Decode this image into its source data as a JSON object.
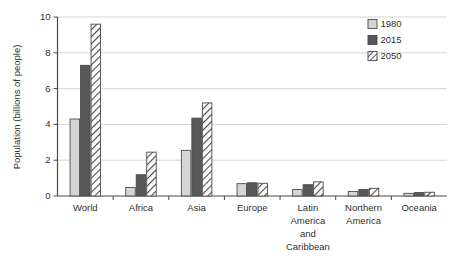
{
  "chart_data": {
    "type": "bar",
    "title": "",
    "xlabel": "",
    "ylabel": "Population (billions of people)",
    "ylim": [
      0,
      10
    ],
    "yticks": [
      0,
      2,
      4,
      6,
      8,
      10
    ],
    "ytick_labels": [
      "0",
      "2",
      "4",
      "6",
      "8",
      "10"
    ],
    "grid": true,
    "legend_position": "top-right",
    "categories": [
      "World",
      "Africa",
      "Asia",
      "Europe",
      "Latin America and Caribbean",
      "Northern America",
      "Oceania"
    ],
    "category_label_lines": [
      [
        "World"
      ],
      [
        "Africa"
      ],
      [
        "Asia"
      ],
      [
        "Europe"
      ],
      [
        "Latin",
        "America",
        "and",
        "Caribbean"
      ],
      [
        "Northern",
        "America"
      ],
      [
        "Oceania"
      ]
    ],
    "series": [
      {
        "name": "1980",
        "fill": "#d5d5d5",
        "pattern": "solid",
        "values": [
          4.3,
          0.48,
          2.55,
          0.69,
          0.36,
          0.25,
          0.15
        ]
      },
      {
        "name": "2015",
        "fill": "#585858",
        "pattern": "solid",
        "values": [
          7.3,
          1.19,
          4.35,
          0.74,
          0.63,
          0.36,
          0.19
        ]
      },
      {
        "name": "2050",
        "fill": "#ffffff",
        "pattern": "diagonal-hatch",
        "values": [
          9.6,
          2.45,
          5.2,
          0.71,
          0.79,
          0.43,
          0.21
        ]
      }
    ]
  },
  "legend": {
    "entries": [
      {
        "label": "1980",
        "swatch": "light-gray-swatch"
      },
      {
        "label": "2015",
        "swatch": "dark-gray-swatch"
      },
      {
        "label": "2050",
        "swatch": "hatched-swatch"
      }
    ]
  },
  "colors": {
    "series_1980": "#d5d5d5",
    "series_2015": "#585858",
    "series_2050_hatch": "#4a4a4a",
    "axis": "#4a4a4a",
    "grid": "#c9c9c9",
    "text": "#2f2f2f",
    "background": "#ffffff"
  }
}
